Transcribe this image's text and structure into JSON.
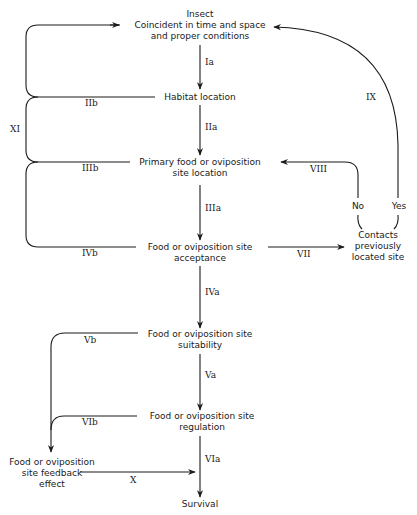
{
  "diagram": {
    "nodes": {
      "insect": {
        "lines": [
          "Insect",
          "Coincident in time and space",
          "and proper conditions"
        ]
      },
      "habitat": {
        "lines": [
          "Habitat location"
        ]
      },
      "primary": {
        "lines": [
          "Primary food or oviposition",
          "site location"
        ]
      },
      "acceptance": {
        "lines": [
          "Food or oviposition site",
          "acceptance"
        ]
      },
      "contacts": {
        "lines": [
          "Contacts",
          "previously",
          "located site"
        ]
      },
      "suitability": {
        "lines": [
          "Food or oviposition site",
          "suitability"
        ]
      },
      "regulation": {
        "lines": [
          "Food or oviposition site",
          "regulation"
        ]
      },
      "feedback": {
        "lines": [
          "Food or oviposition",
          "site feedback",
          "effect"
        ]
      },
      "survival": {
        "lines": [
          "Survival"
        ]
      }
    },
    "edges": {
      "Ia": "Ia",
      "IIa": "IIa",
      "IIb": "IIb",
      "IIIa": "IIIa",
      "IIIb": "IIIb",
      "IVa": "IVa",
      "IVb": "IVb",
      "Va": "Va",
      "Vb": "Vb",
      "VIa": "VIa",
      "VIb": "VIb",
      "VII": "VII",
      "VIII": "VIII",
      "IX": "IX",
      "X": "X",
      "XI": "XI"
    },
    "branches": {
      "no": "No",
      "yes": "Yes"
    }
  }
}
